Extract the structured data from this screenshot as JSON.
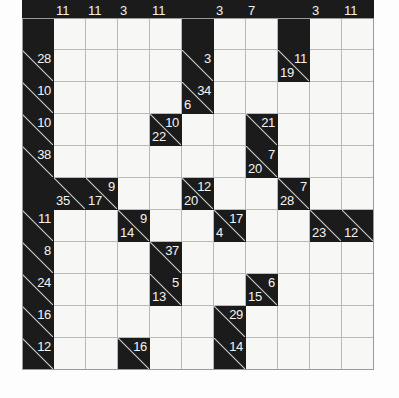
{
  "puzzle": {
    "type": "kakuro",
    "rows": 11,
    "cols": 11,
    "cell_size_px": 32,
    "colors": {
      "block": "#1b1b1b",
      "open_cell": "#f7f7f5",
      "grid_line": "#b9b9b7",
      "clue_text": "#f4f4f4",
      "slash": "#cfcfcf",
      "page_background": "#fdfdfd"
    },
    "legend": {
      "across_clue_position": "top-right of clue cell",
      "down_clue_position": "bottom-left of clue cell"
    },
    "top_strip": {
      "note": "clipped row of clue cells at very top edge, digits cut off",
      "cells": [
        {
          "col": 0,
          "kind": "block"
        },
        {
          "col": 1,
          "kind": "clue",
          "down": "11"
        },
        {
          "col": 2,
          "kind": "clue",
          "down": "11"
        },
        {
          "col": 3,
          "kind": "clue",
          "down": "3"
        },
        {
          "col": 4,
          "kind": "clue",
          "down": "11"
        },
        {
          "col": 5,
          "kind": "block"
        },
        {
          "col": 6,
          "kind": "clue",
          "down": "3"
        },
        {
          "col": 7,
          "kind": "clue",
          "down": "7"
        },
        {
          "col": 8,
          "kind": "block"
        },
        {
          "col": 9,
          "kind": "clue",
          "down": "3"
        },
        {
          "col": 10,
          "kind": "clue",
          "down": "11"
        }
      ]
    },
    "grid": [
      [
        {
          "kind": "block"
        },
        {
          "kind": "open"
        },
        {
          "kind": "open"
        },
        {
          "kind": "open"
        },
        {
          "kind": "open"
        },
        {
          "kind": "block"
        },
        {
          "kind": "open"
        },
        {
          "kind": "open"
        },
        {
          "kind": "block"
        },
        {
          "kind": "open"
        },
        {
          "kind": "open"
        }
      ],
      [
        {
          "kind": "clue",
          "across": "28"
        },
        {
          "kind": "open"
        },
        {
          "kind": "open"
        },
        {
          "kind": "open"
        },
        {
          "kind": "open"
        },
        {
          "kind": "clue",
          "across": "3"
        },
        {
          "kind": "open"
        },
        {
          "kind": "open"
        },
        {
          "kind": "clue",
          "across": "11",
          "down": "19"
        },
        {
          "kind": "open"
        },
        {
          "kind": "open"
        }
      ],
      [
        {
          "kind": "clue",
          "across": "10"
        },
        {
          "kind": "open"
        },
        {
          "kind": "open"
        },
        {
          "kind": "open"
        },
        {
          "kind": "open"
        },
        {
          "kind": "clue",
          "across": "34",
          "down": "6"
        },
        {
          "kind": "open"
        },
        {
          "kind": "open"
        },
        {
          "kind": "open"
        },
        {
          "kind": "open"
        },
        {
          "kind": "open"
        }
      ],
      [
        {
          "kind": "clue",
          "across": "10"
        },
        {
          "kind": "open"
        },
        {
          "kind": "open"
        },
        {
          "kind": "open"
        },
        {
          "kind": "clue",
          "across": "10",
          "down": "22"
        },
        {
          "kind": "open"
        },
        {
          "kind": "open"
        },
        {
          "kind": "clue",
          "across": "21"
        },
        {
          "kind": "open"
        },
        {
          "kind": "open"
        },
        {
          "kind": "open"
        }
      ],
      [
        {
          "kind": "clue",
          "across": "38"
        },
        {
          "kind": "open"
        },
        {
          "kind": "open"
        },
        {
          "kind": "open"
        },
        {
          "kind": "open"
        },
        {
          "kind": "open"
        },
        {
          "kind": "open"
        },
        {
          "kind": "clue",
          "across": "7",
          "down": "20"
        },
        {
          "kind": "open"
        },
        {
          "kind": "open"
        },
        {
          "kind": "open"
        }
      ],
      [
        {
          "kind": "block"
        },
        {
          "kind": "clue",
          "down": "35"
        },
        {
          "kind": "clue",
          "across": "9",
          "down": "17"
        },
        {
          "kind": "open"
        },
        {
          "kind": "open"
        },
        {
          "kind": "clue",
          "across": "12",
          "down": "20"
        },
        {
          "kind": "open"
        },
        {
          "kind": "open"
        },
        {
          "kind": "clue",
          "across": "7",
          "down": "28"
        },
        {
          "kind": "open"
        },
        {
          "kind": "open"
        }
      ],
      [
        {
          "kind": "clue",
          "across": "11"
        },
        {
          "kind": "open"
        },
        {
          "kind": "open"
        },
        {
          "kind": "clue",
          "across": "9",
          "down": "14"
        },
        {
          "kind": "open"
        },
        {
          "kind": "open"
        },
        {
          "kind": "clue",
          "across": "17",
          "down": "4"
        },
        {
          "kind": "open"
        },
        {
          "kind": "open"
        },
        {
          "kind": "clue",
          "down": "23"
        },
        {
          "kind": "clue",
          "down": "12"
        }
      ],
      [
        {
          "kind": "clue",
          "across": "8"
        },
        {
          "kind": "open"
        },
        {
          "kind": "open"
        },
        {
          "kind": "open"
        },
        {
          "kind": "clue",
          "across": "37"
        },
        {
          "kind": "open"
        },
        {
          "kind": "open"
        },
        {
          "kind": "open"
        },
        {
          "kind": "open"
        },
        {
          "kind": "open"
        },
        {
          "kind": "open"
        }
      ],
      [
        {
          "kind": "clue",
          "across": "24"
        },
        {
          "kind": "open"
        },
        {
          "kind": "open"
        },
        {
          "kind": "open"
        },
        {
          "kind": "clue",
          "across": "5",
          "down": "13"
        },
        {
          "kind": "open"
        },
        {
          "kind": "open"
        },
        {
          "kind": "clue",
          "across": "6",
          "down": "15"
        },
        {
          "kind": "open"
        },
        {
          "kind": "open"
        },
        {
          "kind": "open"
        }
      ],
      [
        {
          "kind": "clue",
          "across": "16"
        },
        {
          "kind": "open"
        },
        {
          "kind": "open"
        },
        {
          "kind": "open"
        },
        {
          "kind": "open"
        },
        {
          "kind": "open"
        },
        {
          "kind": "clue",
          "across": "29"
        },
        {
          "kind": "open"
        },
        {
          "kind": "open"
        },
        {
          "kind": "open"
        },
        {
          "kind": "open"
        }
      ],
      [
        {
          "kind": "clue",
          "across": "12"
        },
        {
          "kind": "open"
        },
        {
          "kind": "open"
        },
        {
          "kind": "clue",
          "across": "16"
        },
        {
          "kind": "open"
        },
        {
          "kind": "open"
        },
        {
          "kind": "clue",
          "across": "14"
        },
        {
          "kind": "open"
        },
        {
          "kind": "open"
        },
        {
          "kind": "open"
        },
        {
          "kind": "open"
        }
      ]
    ]
  }
}
